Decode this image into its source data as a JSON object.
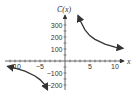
{
  "chart_data": {
    "type": "line",
    "title": "",
    "xlabel": "x",
    "ylabel": "C̄(x)",
    "xlim": [
      -12,
      12
    ],
    "ylim": [
      -250,
      400
    ],
    "x_ticks": [
      "-10",
      "-5",
      "5",
      "10"
    ],
    "y_ticks": [
      "300",
      "200",
      "100",
      "-100",
      "-200"
    ],
    "grid": false,
    "series": [
      {
        "name": "right branch",
        "x": [
          2.6,
          3,
          4,
          5,
          6,
          8,
          10,
          11.6
        ],
        "y": [
          380,
          340,
          260,
          210,
          180,
          140,
          115,
          105
        ]
      },
      {
        "name": "left branch",
        "x": [
          -11.5,
          -10,
          -8,
          -6,
          -5,
          -4,
          -3.5
        ],
        "y": [
          -45,
          -60,
          -85,
          -125,
          -155,
          -200,
          -240
        ]
      }
    ],
    "color": "#333333"
  }
}
